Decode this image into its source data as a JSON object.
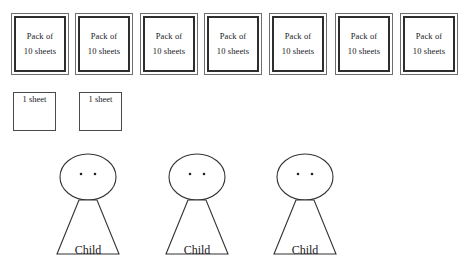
{
  "page": {
    "background_color": "#ffffff",
    "width": 465,
    "height": 265
  },
  "packs_row": {
    "count": 7,
    "border_color": "#2e2e2e",
    "items": [
      {
        "line1": "Pack of",
        "line2": "10 sheets",
        "x": 11,
        "y": 13
      },
      {
        "line1": "Pack of",
        "line2": "10 sheets",
        "x": 75,
        "y": 13
      },
      {
        "line1": "Pack of",
        "line2": "10 sheets",
        "x": 140,
        "y": 13
      },
      {
        "line1": "Pack of",
        "line2": "10 sheets",
        "x": 204,
        "y": 13
      },
      {
        "line1": "Pack of",
        "line2": "10 sheets",
        "x": 269,
        "y": 13
      },
      {
        "line1": "Pack of",
        "line2": "10 sheets",
        "x": 335,
        "y": 13
      },
      {
        "line1": "Pack of",
        "line2": "10 sheets",
        "x": 400,
        "y": 13
      }
    ]
  },
  "sheets_row": {
    "count": 2,
    "border_color": "#4a4a4a",
    "items": [
      {
        "label": "1 sheet",
        "x": 13,
        "y": 92
      },
      {
        "label": "1 sheet",
        "x": 79,
        "y": 92
      }
    ]
  },
  "children_row": {
    "count": 3,
    "stroke_color": "#333333",
    "items": [
      {
        "name": "Child",
        "x": 40,
        "y": 150
      },
      {
        "name": "Child",
        "x": 149,
        "y": 150
      },
      {
        "name": "Child",
        "x": 257,
        "y": 150
      }
    ]
  }
}
